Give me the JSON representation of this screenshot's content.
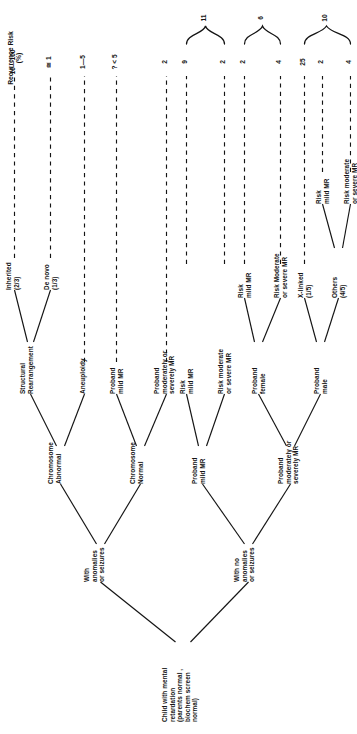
{
  "figure": {
    "header": "Recurrence Risk\n(%)",
    "root": {
      "label": "Child with mental\nretardation\n(parents normal ,\nbiochem screen\nnormal)"
    },
    "branches": {
      "with_anomalies": "With\nanomalies\nor seizures",
      "with_no_anomalies": "With no\nanomalies\nor seizures"
    },
    "nodes": {
      "chromosome_abnormal": "Chromosome\nAbnormal",
      "chromosome_normal": "Chromosome\nNormal",
      "structural_rearrangement": "Structural\nRearrangement",
      "aneuploidy": "Aneuploidy",
      "inherited": "Inherited\n(2/3)",
      "de_novo": "De novo\n(1/3)",
      "proband_mild_mr_a": "Proband\nmild MR",
      "proband_mod_severe_a": "Proband\nmoderately or\nseverely MR",
      "proband_mild_mr_b": "Proband\nmild MR",
      "proband_mod_severe_b": "Proband\nmoderately or\nseverely MR",
      "risk_mild_mr_1": "Risk\nmild MR",
      "risk_mod_severe_1": "Risk moderate\nor severe MR",
      "risk_mild_mr_2": "Risk\nmild MR",
      "risk_mod_severe_2": "Risk Moderate\nor severe MR",
      "proband_female": "Proband\nfemale",
      "proband_male": "Proband\nmale",
      "x_linked": "X-linked\n(1/5)",
      "others": "Others\n(4/5)",
      "risk_mild_mr_3": "Risk\nmild MR",
      "risk_mod_severe_3": "Risk moderate\nor severe MR"
    },
    "risk_values": [
      {
        "id": "inherited",
        "value": "10—100"
      },
      {
        "id": "de-novo",
        "value": "≅ 1"
      },
      {
        "id": "aneuploidy",
        "value": "1—5"
      },
      {
        "id": "proband-mild-mr-a",
        "value": "? < 5"
      },
      {
        "id": "proband-mod-severe-a",
        "value": "2"
      },
      {
        "id": "risk-mild-mr-1",
        "value": "9"
      },
      {
        "id": "risk-mod-severe-1",
        "value": "2"
      },
      {
        "id": "risk-mild-mr-2",
        "value": "2"
      },
      {
        "id": "risk-mod-severe-2",
        "value": "4"
      },
      {
        "id": "x-linked",
        "value": "25"
      },
      {
        "id": "risk-mild-mr-3",
        "value": "2"
      },
      {
        "id": "risk-mod-severe-3",
        "value": "4"
      }
    ],
    "brace_totals": [
      {
        "id": "proband-female-total",
        "value": "11"
      },
      {
        "id": "proband-male-total",
        "value": "6"
      },
      {
        "id": "others-total",
        "value": "10"
      }
    ]
  }
}
